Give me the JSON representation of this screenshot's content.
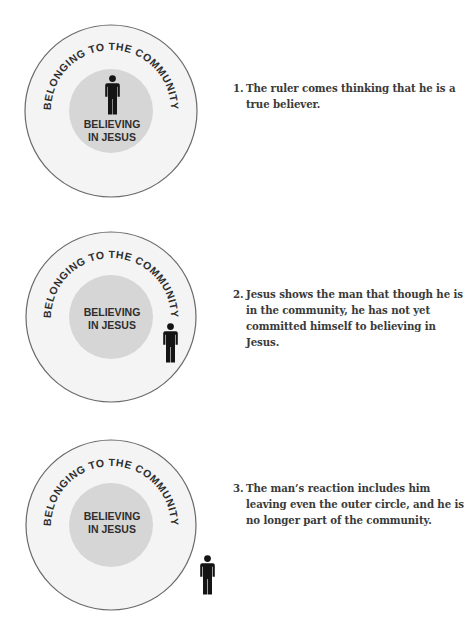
{
  "labels": {
    "outer_circle": "BELONGING TO THE COMMUNITY",
    "inner_circle_line1": "BELIEVING",
    "inner_circle_line2": "IN JESUS"
  },
  "colors": {
    "outer_fill": "#f4f4f4",
    "outer_stroke": "#6a6a6a",
    "inner_fill": "#d6d6d6",
    "label_text": "#2e2e2e",
    "figure": "#141414",
    "caption_text": "#3a3a3a"
  },
  "panels": [
    {
      "number": "1.",
      "caption": "The ruler comes thinking that he is a true believer.",
      "figure_position": "inside-inner-circle"
    },
    {
      "number": "2.",
      "caption": "Jesus shows the man that though he is in the community, he has not yet committed himself to believing in Jesus.",
      "figure_position": "inside-outer-circle-only"
    },
    {
      "number": "3.",
      "caption": "The man’s reaction includes him leaving even the outer circle, and he is no longer part of the community.",
      "figure_position": "outside-outer-circle"
    }
  ],
  "icons": {
    "figure": "person-icon"
  }
}
